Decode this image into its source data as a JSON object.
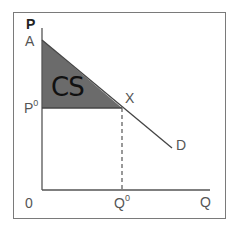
{
  "diagram": {
    "axes": {
      "y_label": "P",
      "x_label": "Q",
      "origin_label": "0"
    },
    "points": {
      "intercept_label": "A",
      "price_label_base": "P",
      "price_label_sup": "0",
      "quantity_label_base": "Q",
      "quantity_label_sup": "0",
      "equilibrium_label": "X"
    },
    "curve_label": "D",
    "region_label": "CS",
    "colors": {
      "region_fill": "#6b6b6b",
      "line": "#444444",
      "frame": "#7a7a7a",
      "text": "#555555"
    }
  }
}
